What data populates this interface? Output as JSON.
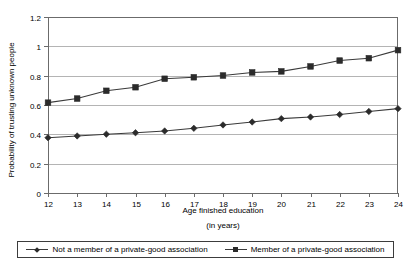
{
  "chart_data": {
    "type": "line",
    "title": "",
    "xlabel": "Age finished education",
    "xlabel_sub": "(in years)",
    "ylabel": "Probability of trusting unknown people",
    "x": [
      12,
      13,
      14,
      15,
      16,
      17,
      18,
      19,
      20,
      21,
      22,
      23,
      24
    ],
    "xticklabels": [
      "12",
      "13",
      "14",
      "15",
      "16",
      "17",
      "18",
      "19",
      "20",
      "21",
      "22",
      "23",
      "24"
    ],
    "yticklabels": [
      "0",
      "0.2",
      "0.4",
      "0.6",
      "0.8",
      "1",
      "1.2"
    ],
    "yticks": [
      0,
      0.2,
      0.4,
      0.6,
      0.8,
      1,
      1.2
    ],
    "ylim": [
      0,
      1.2
    ],
    "xlim": [
      12,
      24
    ],
    "grid": "horizontal",
    "legend_position": "bottom",
    "series": [
      {
        "name": "Not a member of a private-good association",
        "marker": "diamond",
        "color": "#2b2b2b",
        "values": [
          0.377,
          0.389,
          0.401,
          0.411,
          0.423,
          0.441,
          0.464,
          0.484,
          0.507,
          0.518,
          0.535,
          0.556,
          0.575
        ]
      },
      {
        "name": "Member of a private-good association",
        "marker": "square",
        "color": "#2b2b2b",
        "values": [
          0.616,
          0.644,
          0.697,
          0.721,
          0.779,
          0.789,
          0.801,
          0.822,
          0.829,
          0.863,
          0.903,
          0.919,
          0.974
        ]
      }
    ]
  },
  "legend": {
    "entries": [
      {
        "label": "Not a member of a private-good association"
      },
      {
        "label": "Member of a private-good association"
      }
    ]
  },
  "colors": {
    "line": "#3a3a3a",
    "marker": "#2b2b2b",
    "grid": "#b4b4b4",
    "axis": "#6b6b6b",
    "background": "#ffffff"
  }
}
